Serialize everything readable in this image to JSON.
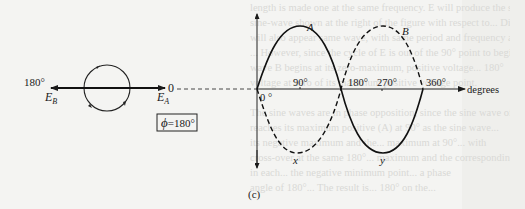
{
  "figure": {
    "caption": "(c)",
    "phase_box": {
      "symbol": "ϕ",
      "text": "=180°"
    },
    "phasor": {
      "left_angle": "180°",
      "left_label": "E",
      "left_sub": "B",
      "right_angle": "0",
      "right_label": "E",
      "right_sub": "A"
    },
    "axis": {
      "x_label": "degrees",
      "ticks": [
        "0 °",
        "90°",
        "180°",
        "270°",
        "360°"
      ]
    },
    "curves": {
      "A": {
        "label": "A",
        "style": "solid"
      },
      "B": {
        "label": "B",
        "style": "dashed"
      },
      "x_label": "x",
      "y_label": "y"
    }
  },
  "background_text": [
    "length is made one at the same frequency. E will produce the similar",
    "sine-wave shown at the right of the figure with respect to... Diagram E",
    "will also appear same wave, with same period and frequency as the same",
    "... However, since the cycle of E is out of the 90° point to begin with",
    "wave B begins at its zero-maximum, positive voltage... 180°",
    "voltage at zero of its maximum positive voltage point.",
    "",
    "The sine waves are in phase opposition, since the sine wave of E(b)",
    "reaches its maximum positive (A) at 90° as the sine wave...",
    "its negative maximum and the... maximum at 90°... with",
    "cross-over at the same 180°... maximum and the corresponding",
    "in each... the negative minimum point... a phase",
    "angle of 180°... The result is... 180° on the..."
  ]
}
